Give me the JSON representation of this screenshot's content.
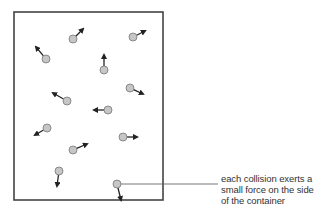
{
  "diagram": {
    "container": {
      "x": 14,
      "y": 12,
      "width": 149,
      "height": 188,
      "stroke": "#444444"
    },
    "particle_color": "#c6c6c6",
    "particle_stroke": "#777777",
    "arrow_color": "#222222",
    "particles": [
      {
        "x": 73,
        "y": 39,
        "dx": 10,
        "dy": -10
      },
      {
        "x": 133,
        "y": 37,
        "dx": 12,
        "dy": -6
      },
      {
        "x": 46,
        "y": 59,
        "dx": -10,
        "dy": -12
      },
      {
        "x": 104,
        "y": 70,
        "dx": 0,
        "dy": -15
      },
      {
        "x": 67,
        "y": 101,
        "dx": -14,
        "dy": -8
      },
      {
        "x": 130,
        "y": 88,
        "dx": 13,
        "dy": 6
      },
      {
        "x": 108,
        "y": 110,
        "dx": -14,
        "dy": 0
      },
      {
        "x": 47,
        "y": 128,
        "dx": -12,
        "dy": 7
      },
      {
        "x": 123,
        "y": 137,
        "dx": 14,
        "dy": 0
      },
      {
        "x": 73,
        "y": 150,
        "dx": 14,
        "dy": -6
      },
      {
        "x": 59,
        "y": 171,
        "dx": -2,
        "dy": 15
      },
      {
        "x": 117,
        "y": 184,
        "dx": 4,
        "dy": 16
      }
    ],
    "leader_line": {
      "x1": 121,
      "y1": 184,
      "x2": 218,
      "y2": 184
    },
    "annotation": {
      "lines": [
        "each collision exerts a",
        "small force on the side",
        "of the container"
      ]
    }
  }
}
